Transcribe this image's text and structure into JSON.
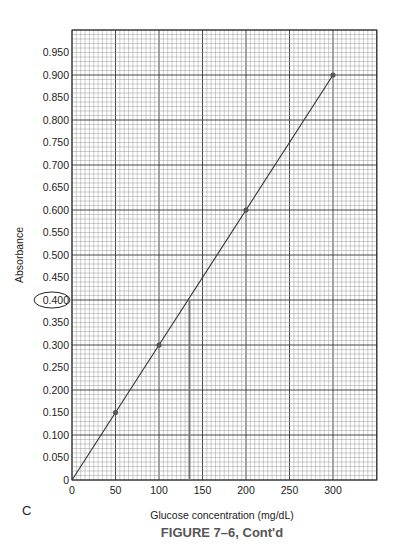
{
  "chart_data": {
    "type": "line",
    "title": "FIGURE 7–6, Cont'd",
    "panel_label": "C",
    "xlabel": "Glucose concentration (mg/dL)",
    "ylabel": "Absorbance",
    "xlim": [
      0,
      360
    ],
    "ylim": [
      0,
      1.0
    ],
    "x_ticks": [
      0,
      50,
      100,
      150,
      200,
      250,
      300
    ],
    "x_tick_labels": [
      "0",
      "50",
      "100",
      "150",
      "200",
      "250",
      "300"
    ],
    "y_ticks": [
      0,
      0.05,
      0.1,
      0.15,
      0.2,
      0.25,
      0.3,
      0.35,
      0.4,
      0.45,
      0.5,
      0.55,
      0.6,
      0.65,
      0.7,
      0.75,
      0.8,
      0.85,
      0.9,
      0.95
    ],
    "y_tick_labels": [
      "0",
      "0.050",
      "0.100",
      "0.150",
      "0.200",
      "0.250",
      "0.300",
      "0.350",
      "0.400",
      "0.450",
      "0.500",
      "0.550",
      "0.600",
      "0.650",
      "0.700",
      "0.750",
      "0.800",
      "0.850",
      "0.900",
      "0.950"
    ],
    "grid": true,
    "series": [
      {
        "name": "Standard curve",
        "x": [
          0,
          50,
          100,
          200,
          300
        ],
        "y": [
          0,
          0.15,
          0.3,
          0.6,
          0.9
        ],
        "markers": [
          50,
          100,
          200,
          300
        ]
      }
    ],
    "annotations": [
      {
        "type": "circled_tick",
        "label": "0.400",
        "y": 0.4
      },
      {
        "type": "reading_line",
        "x": 135,
        "y": 0.4,
        "description": "Absorbance 0.400 corresponds to ~135 mg/dL"
      }
    ]
  }
}
